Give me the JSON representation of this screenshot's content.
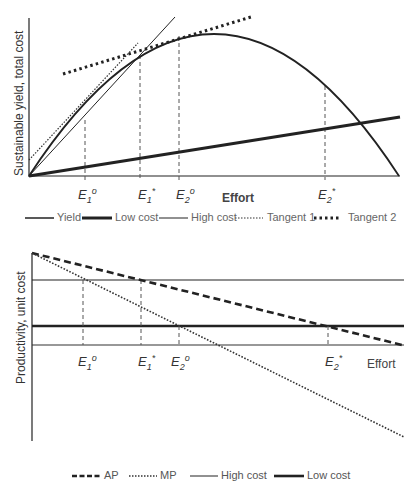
{
  "top_chart": {
    "y_axis_label": "Sustainable yield, total cost",
    "x_axis_label": "Effort",
    "effort_markers": [
      {
        "base": "E",
        "sub": "1",
        "sup": "o",
        "label": "E1°"
      },
      {
        "base": "E",
        "sub": "1",
        "sup": "*",
        "label": "E1*"
      },
      {
        "base": "E",
        "sub": "2",
        "sup": "o",
        "label": "E2°"
      },
      {
        "base": "E",
        "sub": "2",
        "sup": "*",
        "label": "E2*"
      }
    ],
    "legend": [
      {
        "label": "Yield",
        "style": "solid-medium"
      },
      {
        "label": "Low cost",
        "style": "solid-thick"
      },
      {
        "label": "High cost",
        "style": "solid-thin"
      },
      {
        "label": "Tangent 1",
        "style": "dotted-fine"
      },
      {
        "label": "Tangent 2",
        "style": "dotted-bold"
      }
    ]
  },
  "bottom_chart": {
    "y_axis_label": "Productivity, unit cost",
    "x_axis_label": "Effort",
    "effort_markers": [
      {
        "base": "E",
        "sub": "1",
        "sup": "o",
        "label": "E1°"
      },
      {
        "base": "E",
        "sub": "1",
        "sup": "*",
        "label": "E1*"
      },
      {
        "base": "E",
        "sub": "2",
        "sup": "o",
        "label": "E2°"
      },
      {
        "base": "E",
        "sub": "2",
        "sup": "*",
        "label": "E2*"
      }
    ],
    "legend": [
      {
        "label": "AP",
        "style": "dashed"
      },
      {
        "label": "MP",
        "style": "dotted-fine"
      },
      {
        "label": "High cost",
        "style": "solid-thin"
      },
      {
        "label": "Low cost",
        "style": "solid-thick"
      }
    ]
  },
  "colors": {
    "line": "#222222",
    "dashed_marker": "#555555",
    "text": "#333333"
  }
}
